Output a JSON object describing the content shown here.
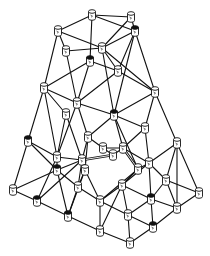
{
  "diagram": {
    "title": "",
    "type": "network-mesh",
    "node_shape": "cylinder",
    "colors": {
      "line": "#111111",
      "node_fill": "#ffffff",
      "background": "#ffffff"
    },
    "nodes": [
      {
        "id": "n1",
        "x": 92,
        "y": 15
      },
      {
        "id": "n2",
        "x": 131,
        "y": 17
      },
      {
        "id": "n3",
        "x": 58,
        "y": 31
      },
      {
        "id": "n4",
        "x": 135,
        "y": 31,
        "dark": true
      },
      {
        "id": "n5",
        "x": 66,
        "y": 51
      },
      {
        "id": "n6",
        "x": 102,
        "y": 48
      },
      {
        "id": "n7",
        "x": 90,
        "y": 61,
        "dark": true
      },
      {
        "id": "n8",
        "x": 118,
        "y": 71
      },
      {
        "id": "n9",
        "x": 44,
        "y": 88
      },
      {
        "id": "n10",
        "x": 155,
        "y": 92
      },
      {
        "id": "n11",
        "x": 77,
        "y": 103
      },
      {
        "id": "n12",
        "x": 66,
        "y": 114
      },
      {
        "id": "n13",
        "x": 114,
        "y": 115,
        "dark": true
      },
      {
        "id": "n14",
        "x": 145,
        "y": 128
      },
      {
        "id": "n15",
        "x": 28,
        "y": 141,
        "dark": true
      },
      {
        "id": "n16",
        "x": 88,
        "y": 137
      },
      {
        "id": "n17",
        "x": 57,
        "y": 157
      },
      {
        "id": "n18",
        "x": 103,
        "y": 148
      },
      {
        "id": "n19",
        "x": 123,
        "y": 148
      },
      {
        "id": "n20",
        "x": 113,
        "y": 155
      },
      {
        "id": "n21",
        "x": 177,
        "y": 143
      },
      {
        "id": "n22",
        "x": 82,
        "y": 160
      },
      {
        "id": "n23",
        "x": 149,
        "y": 163
      },
      {
        "id": "n24",
        "x": 57,
        "y": 170,
        "dark": true
      },
      {
        "id": "n25",
        "x": 85,
        "y": 170
      },
      {
        "id": "n26",
        "x": 138,
        "y": 169
      },
      {
        "id": "n27",
        "x": 166,
        "y": 180
      },
      {
        "id": "n28",
        "x": 13,
        "y": 190
      },
      {
        "id": "n29",
        "x": 78,
        "y": 187
      },
      {
        "id": "n30",
        "x": 122,
        "y": 185
      },
      {
        "id": "n31",
        "x": 37,
        "y": 201,
        "dark": true
      },
      {
        "id": "n32",
        "x": 100,
        "y": 201
      },
      {
        "id": "n33",
        "x": 151,
        "y": 199,
        "dark": true
      },
      {
        "id": "n34",
        "x": 199,
        "y": 193
      },
      {
        "id": "n35",
        "x": 177,
        "y": 208
      },
      {
        "id": "n36",
        "x": 68,
        "y": 216,
        "dark": true
      },
      {
        "id": "n37",
        "x": 128,
        "y": 215
      },
      {
        "id": "n38",
        "x": 153,
        "y": 227,
        "dark": true
      },
      {
        "id": "n39",
        "x": 100,
        "y": 231
      },
      {
        "id": "n40",
        "x": 130,
        "y": 243
      }
    ],
    "edges": [
      [
        "n1",
        "n2"
      ],
      [
        "n1",
        "n3"
      ],
      [
        "n1",
        "n4"
      ],
      [
        "n1",
        "n7"
      ],
      [
        "n2",
        "n4"
      ],
      [
        "n2",
        "n6"
      ],
      [
        "n3",
        "n5"
      ],
      [
        "n3",
        "n6"
      ],
      [
        "n3",
        "n9"
      ],
      [
        "n4",
        "n6"
      ],
      [
        "n4",
        "n10"
      ],
      [
        "n4",
        "n13"
      ],
      [
        "n4",
        "n8"
      ],
      [
        "n5",
        "n6"
      ],
      [
        "n5",
        "n11"
      ],
      [
        "n6",
        "n8"
      ],
      [
        "n6",
        "n13"
      ],
      [
        "n6",
        "n10"
      ],
      [
        "n7",
        "n8"
      ],
      [
        "n7",
        "n9"
      ],
      [
        "n7",
        "n11"
      ],
      [
        "n8",
        "n10"
      ],
      [
        "n8",
        "n11"
      ],
      [
        "n9",
        "n11"
      ],
      [
        "n9",
        "n15"
      ],
      [
        "n9",
        "n12"
      ],
      [
        "n9",
        "n17"
      ],
      [
        "n10",
        "n13"
      ],
      [
        "n10",
        "n14"
      ],
      [
        "n10",
        "n21"
      ],
      [
        "n11",
        "n13"
      ],
      [
        "n11",
        "n16"
      ],
      [
        "n11",
        "n17"
      ],
      [
        "n12",
        "n17"
      ],
      [
        "n12",
        "n22"
      ],
      [
        "n13",
        "n16"
      ],
      [
        "n13",
        "n19"
      ],
      [
        "n13",
        "n14"
      ],
      [
        "n13",
        "n26"
      ],
      [
        "n14",
        "n19"
      ],
      [
        "n14",
        "n23"
      ],
      [
        "n15",
        "n17"
      ],
      [
        "n15",
        "n28"
      ],
      [
        "n15",
        "n24"
      ],
      [
        "n16",
        "n18"
      ],
      [
        "n16",
        "n22"
      ],
      [
        "n16",
        "n25"
      ],
      [
        "n17",
        "n22"
      ],
      [
        "n17",
        "n24"
      ],
      [
        "n17",
        "n31"
      ],
      [
        "n18",
        "n19"
      ],
      [
        "n18",
        "n20"
      ],
      [
        "n19",
        "n20"
      ],
      [
        "n19",
        "n23"
      ],
      [
        "n21",
        "n23"
      ],
      [
        "n21",
        "n27"
      ],
      [
        "n21",
        "n34"
      ],
      [
        "n21",
        "n35"
      ],
      [
        "n22",
        "n24"
      ],
      [
        "n22",
        "n25"
      ],
      [
        "n22",
        "n29"
      ],
      [
        "n22",
        "n31"
      ],
      [
        "n23",
        "n26"
      ],
      [
        "n23",
        "n27"
      ],
      [
        "n23",
        "n30"
      ],
      [
        "n23",
        "n33"
      ],
      [
        "n24",
        "n28"
      ],
      [
        "n24",
        "n29"
      ],
      [
        "n24",
        "n36"
      ],
      [
        "n25",
        "n29"
      ],
      [
        "n25",
        "n32"
      ],
      [
        "n25",
        "n36"
      ],
      [
        "n26",
        "n30"
      ],
      [
        "n26",
        "n32"
      ],
      [
        "n27",
        "n33"
      ],
      [
        "n27",
        "n34"
      ],
      [
        "n27",
        "n35"
      ],
      [
        "n28",
        "n31"
      ],
      [
        "n29",
        "n32"
      ],
      [
        "n29",
        "n36"
      ],
      [
        "n30",
        "n32"
      ],
      [
        "n30",
        "n33"
      ],
      [
        "n30",
        "n37"
      ],
      [
        "n30",
        "n39"
      ],
      [
        "n31",
        "n36"
      ],
      [
        "n32",
        "n37"
      ],
      [
        "n32",
        "n39"
      ],
      [
        "n33",
        "n38"
      ],
      [
        "n33",
        "n35"
      ],
      [
        "n33",
        "n37"
      ],
      [
        "n34",
        "n35"
      ],
      [
        "n35",
        "n38"
      ],
      [
        "n36",
        "n39"
      ],
      [
        "n37",
        "n38"
      ],
      [
        "n37",
        "n40"
      ],
      [
        "n38",
        "n40"
      ],
      [
        "n39",
        "n40"
      ]
    ],
    "double_edges": [
      [
        "n20",
        "n22"
      ],
      [
        "n26",
        "n19"
      ]
    ]
  }
}
